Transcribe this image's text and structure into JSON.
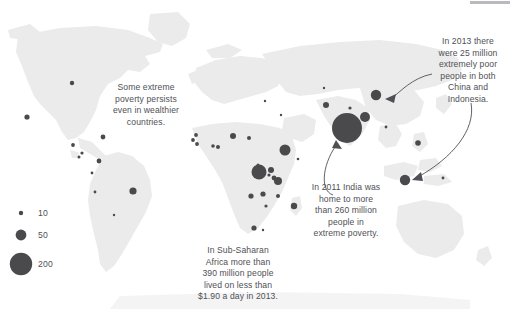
{
  "chart_data": {
    "type": "scatter",
    "title": "",
    "subtitle": "",
    "xlabel": "",
    "ylabel": "",
    "grid": false,
    "legend_position": "bottom-left",
    "value_unit": "millions of people living on less than $1.90 a day",
    "size_legend": {
      "name": "bubble-size-legend",
      "entries": [
        {
          "label": "10",
          "value": 10,
          "radius_px": 2.2
        },
        {
          "label": "50",
          "value": 50,
          "radius_px": 5.4
        },
        {
          "label": "200",
          "value": 200,
          "radius_px": 11.2
        }
      ]
    },
    "bubble_color": "#4a4a4c",
    "land_color": "#ebebeb",
    "ocean_color": "#ffffff",
    "annotations": [
      {
        "name": "annotation-wealthier-countries",
        "text": "Some extreme\npoverty persists\neven in wealthier\ncountries.",
        "has_arrow": false
      },
      {
        "name": "annotation-china-indonesia",
        "text": "In 2013 there\nwere 25 million\nextremely poor\npeople in both\nChina and\nIndonesia.",
        "has_arrow": true,
        "arrow_targets": [
          "China",
          "Indonesia"
        ]
      },
      {
        "name": "annotation-india",
        "text": "In 2011 India was\nhome to more\nthan 260 million\npeople in\nextreme poverty.",
        "has_arrow": true,
        "arrow_targets": [
          "India"
        ]
      },
      {
        "name": "annotation-sub-saharan-africa",
        "text": "In Sub-Saharan\nAfrica more than\n390 million people\nlived on less than\n$1.90 a day in 2013.",
        "has_arrow": false
      }
    ],
    "points": [
      {
        "name": "Canada",
        "x": 72,
        "y": 83,
        "r": 2.2,
        "value": 10
      },
      {
        "name": "United States",
        "x": 27,
        "y": 117,
        "r": 2.6,
        "value": 12
      },
      {
        "name": "Mexico",
        "x": 103,
        "y": 137,
        "r": 2.4,
        "value": 11
      },
      {
        "name": "Guatemala",
        "x": 73,
        "y": 145,
        "r": 1.9,
        "value": 8
      },
      {
        "name": "Honduras",
        "x": 82,
        "y": 153,
        "r": 1.6,
        "value": 6
      },
      {
        "name": "Haiti",
        "x": 79,
        "y": 157,
        "r": 1.5,
        "value": 5
      },
      {
        "name": "Colombia",
        "x": 99,
        "y": 161,
        "r": 2.4,
        "value": 10
      },
      {
        "name": "Peru",
        "x": 92,
        "y": 173,
        "r": 1.4,
        "value": 4
      },
      {
        "name": "Bolivia",
        "x": 95,
        "y": 192,
        "r": 1.4,
        "value": 4
      },
      {
        "name": "Brazil",
        "x": 133,
        "y": 191,
        "r": 3.6,
        "value": 22
      },
      {
        "name": "Argentina",
        "x": 114,
        "y": 215,
        "r": 1.2,
        "value": 3
      },
      {
        "name": "Morocco",
        "x": 196,
        "y": 135,
        "r": 1.9,
        "value": 8
      },
      {
        "name": "Senegal",
        "x": 193,
        "y": 140,
        "r": 1.9,
        "value": 8
      },
      {
        "name": "Guinea",
        "x": 197,
        "y": 144,
        "r": 1.9,
        "value": 8
      },
      {
        "name": "Mali",
        "x": 213,
        "y": 146,
        "r": 1.8,
        "value": 7
      },
      {
        "name": "Burkina Faso",
        "x": 218,
        "y": 147,
        "r": 2.0,
        "value": 9
      },
      {
        "name": "Niger",
        "x": 233,
        "y": 136,
        "r": 3.0,
        "value": 16
      },
      {
        "name": "Ghana",
        "x": 249,
        "y": 138,
        "r": 2.0,
        "value": 9
      },
      {
        "name": "Nigeria",
        "x": 285,
        "y": 150,
        "r": 5.5,
        "value": 52
      },
      {
        "name": "Sudan",
        "x": 258,
        "y": 165,
        "r": 1.5,
        "value": 5
      },
      {
        "name": "Ethiopia",
        "x": 271,
        "y": 170,
        "r": 3.0,
        "value": 16
      },
      {
        "name": "DR Congo",
        "x": 259,
        "y": 172,
        "r": 7.5,
        "value": 90
      },
      {
        "name": "Uganda",
        "x": 269,
        "y": 175,
        "r": 1.6,
        "value": 6
      },
      {
        "name": "Kenya",
        "x": 274,
        "y": 178,
        "r": 2.4,
        "value": 11
      },
      {
        "name": "Tanzania",
        "x": 278,
        "y": 181,
        "r": 4.0,
        "value": 26
      },
      {
        "name": "Angola",
        "x": 251,
        "y": 196,
        "r": 2.6,
        "value": 13
      },
      {
        "name": "Zambia",
        "x": 263,
        "y": 194,
        "r": 2.6,
        "value": 13
      },
      {
        "name": "Mozambique",
        "x": 278,
        "y": 196,
        "r": 2.0,
        "value": 9
      },
      {
        "name": "Zimbabwe",
        "x": 266,
        "y": 206,
        "r": 1.6,
        "value": 6
      },
      {
        "name": "Madagascar",
        "x": 294,
        "y": 206,
        "r": 3.2,
        "value": 18
      },
      {
        "name": "South Africa",
        "x": 254,
        "y": 228,
        "r": 2.6,
        "value": 13
      },
      {
        "name": "Lesotho",
        "x": 263,
        "y": 230,
        "r": 1.2,
        "value": 3
      },
      {
        "name": "Yemen",
        "x": 298,
        "y": 159,
        "r": 1.3,
        "value": 3
      },
      {
        "name": "Turkey",
        "x": 281,
        "y": 115,
        "r": 1.2,
        "value": 3
      },
      {
        "name": "Ukraine",
        "x": 265,
        "y": 101,
        "r": 1.2,
        "value": 3
      },
      {
        "name": "Russia",
        "x": 324,
        "y": 88,
        "r": 1.2,
        "value": 3
      },
      {
        "name": "Pakistan",
        "x": 326,
        "y": 105,
        "r": 3.0,
        "value": 16
      },
      {
        "name": "Nepal",
        "x": 350,
        "y": 108,
        "r": 1.6,
        "value": 6
      },
      {
        "name": "India",
        "x": 347,
        "y": 128,
        "r": 15.0,
        "value": 268
      },
      {
        "name": "Bangladesh",
        "x": 365,
        "y": 117,
        "r": 5.0,
        "value": 45
      },
      {
        "name": "China",
        "x": 376,
        "y": 95,
        "r": 5.2,
        "value": 25
      },
      {
        "name": "Myanmar",
        "x": 386,
        "y": 127,
        "r": 1.4,
        "value": 4
      },
      {
        "name": "Philippines",
        "x": 418,
        "y": 143,
        "r": 2.8,
        "value": 14
      },
      {
        "name": "Indonesia",
        "x": 405,
        "y": 180,
        "r": 5.2,
        "value": 25
      },
      {
        "name": "Papua New Guinea",
        "x": 443,
        "y": 178,
        "r": 1.4,
        "value": 4
      }
    ]
  },
  "legend": {
    "name": "size-legend",
    "items": [
      {
        "label": "10"
      },
      {
        "label": "50"
      },
      {
        "label": "200"
      }
    ]
  },
  "annotations": {
    "wealthier": "Some extreme\npoverty persists\neven in wealthier\ncountries.",
    "china_indonesia": "In 2013 there\nwere 25 million\nextremely poor\npeople in both\nChina and\nIndonesia.",
    "india": "In 2011 India was\nhome to more\nthan 260 million\npeople in\nextreme poverty.",
    "africa": "In Sub-Saharan\nAfrica more than\n390 million people\nlived on less than\n$1.90 a day in 2013."
  },
  "colors": {
    "bubble": "#4a4a4c",
    "land": "#ebebeb",
    "text": "#4f5055",
    "background": "#ffffff",
    "top_bar": "#b9babd"
  }
}
